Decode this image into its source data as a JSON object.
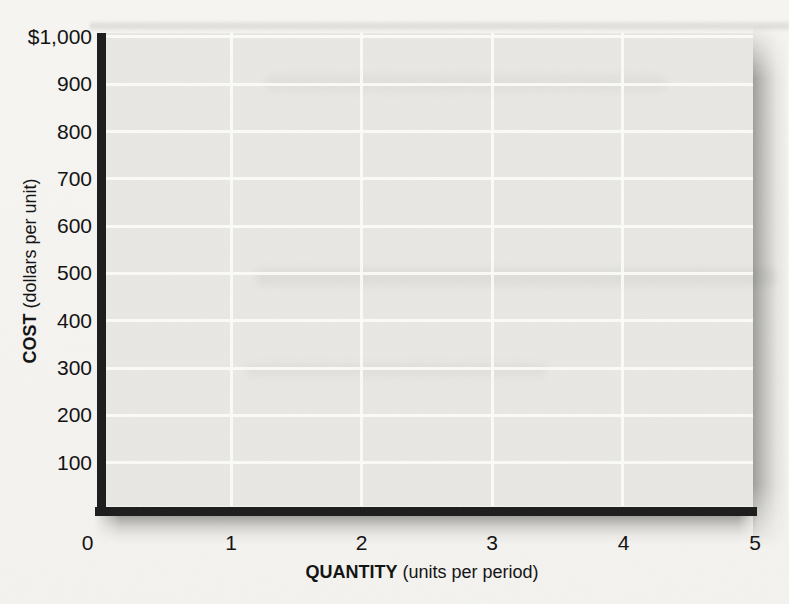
{
  "figure": {
    "y_axis": {
      "title_bold": "COST",
      "title_rest": " (dollars per unit)"
    },
    "x_axis": {
      "title_bold": "QUANTITY",
      "title_rest": " (units per period)"
    },
    "colors": {
      "page_background": "#f5f4f1",
      "plot_background": "#e9e8e5",
      "gridline": "#fcfcf9",
      "axis_line": "#1b1b1b",
      "text": "#101010"
    }
  },
  "chart_data": {
    "type": "line",
    "title": "",
    "xlabel": "QUANTITY (units per period)",
    "ylabel": "COST (dollars per unit)",
    "series": [],
    "xlim": [
      0,
      5
    ],
    "ylim": [
      0,
      1000
    ],
    "x_ticks": [
      0,
      1,
      2,
      3,
      4,
      5
    ],
    "x_tick_labels": [
      "0",
      "1",
      "2",
      "3",
      "4",
      "5"
    ],
    "y_ticks": [
      100,
      200,
      300,
      400,
      500,
      600,
      700,
      800,
      900,
      1000
    ],
    "y_tick_labels": [
      "100",
      "200",
      "300",
      "400",
      "500",
      "600",
      "700",
      "800",
      "900",
      "$1,000"
    ],
    "grid": true,
    "legend": null
  }
}
